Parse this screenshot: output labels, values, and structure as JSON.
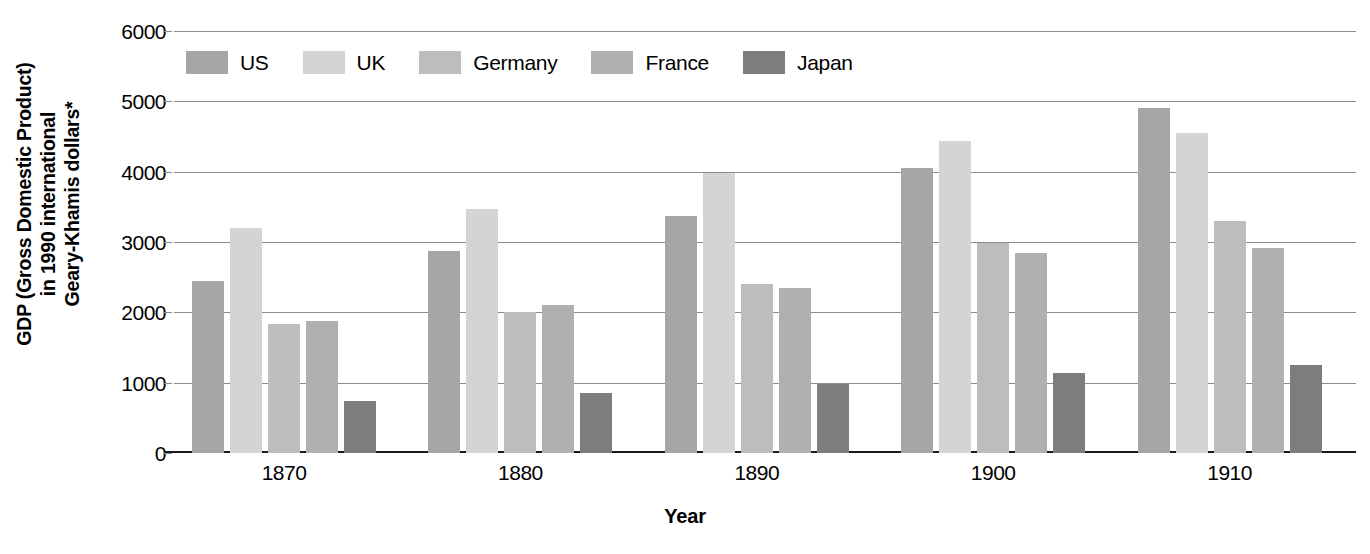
{
  "chart_data": {
    "type": "bar",
    "title": "",
    "xlabel": "Year",
    "ylabel": "GDP (Gross Domestic Product)\nin 1990 international\nGeary-Khamis dollars*",
    "categories": [
      "1870",
      "1880",
      "1890",
      "1900",
      "1910"
    ],
    "ylim": [
      0,
      6000
    ],
    "yticks": [
      "0",
      "1000",
      "2000",
      "3000",
      "4000",
      "5000",
      "6000"
    ],
    "ytick_values": [
      0,
      1000,
      2000,
      3000,
      4000,
      5000,
      6000
    ],
    "grid": true,
    "legend_position": "top-left-inside",
    "series": [
      {
        "name": "US",
        "color": "#a6a6a6",
        "values": [
          2445,
          2870,
          3370,
          4050,
          4910
        ]
      },
      {
        "name": "UK",
        "color": "#d4d4d4",
        "values": [
          3195,
          3465,
          3980,
          4440,
          4555
        ]
      },
      {
        "name": "Germany",
        "color": "#bdbdbd",
        "values": [
          1840,
          2000,
          2400,
          2980,
          3295
        ]
      },
      {
        "name": "France",
        "color": "#b0b0b0",
        "values": [
          1880,
          2105,
          2350,
          2840,
          2920
        ]
      },
      {
        "name": "Japan",
        "color": "#7d7d7d",
        "values": [
          740,
          855,
          980,
          1135,
          1250
        ]
      }
    ]
  },
  "axis": {
    "y_title": "GDP (Gross Domestic Product)\nin 1990 international\nGeary-Khamis dollars*",
    "x_title": "Year"
  },
  "colors": {
    "gridline": "#8c8c8c",
    "baseline": "#1a1a1a",
    "background": "#ffffff",
    "text": "#000000"
  }
}
